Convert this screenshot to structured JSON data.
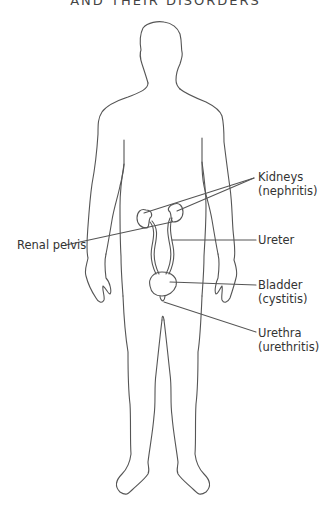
{
  "title": "AND THEIR DISORDERS",
  "diagram": {
    "labels": [
      {
        "id": "kidneys",
        "line1": "Kidneys",
        "line2": "(nephritis)"
      },
      {
        "id": "ureter",
        "line1": "Ureter",
        "line2": ""
      },
      {
        "id": "bladder",
        "line1": "Bladder",
        "line2": "(cystitis)"
      },
      {
        "id": "urethra",
        "line1": "Urethra",
        "line2": "(urethritis)"
      },
      {
        "id": "renal-pelvis",
        "line1": "Renal pelvis",
        "line2": ""
      }
    ],
    "colors": {
      "outline": "#555555",
      "text": "#333333",
      "background": "#ffffff"
    }
  }
}
